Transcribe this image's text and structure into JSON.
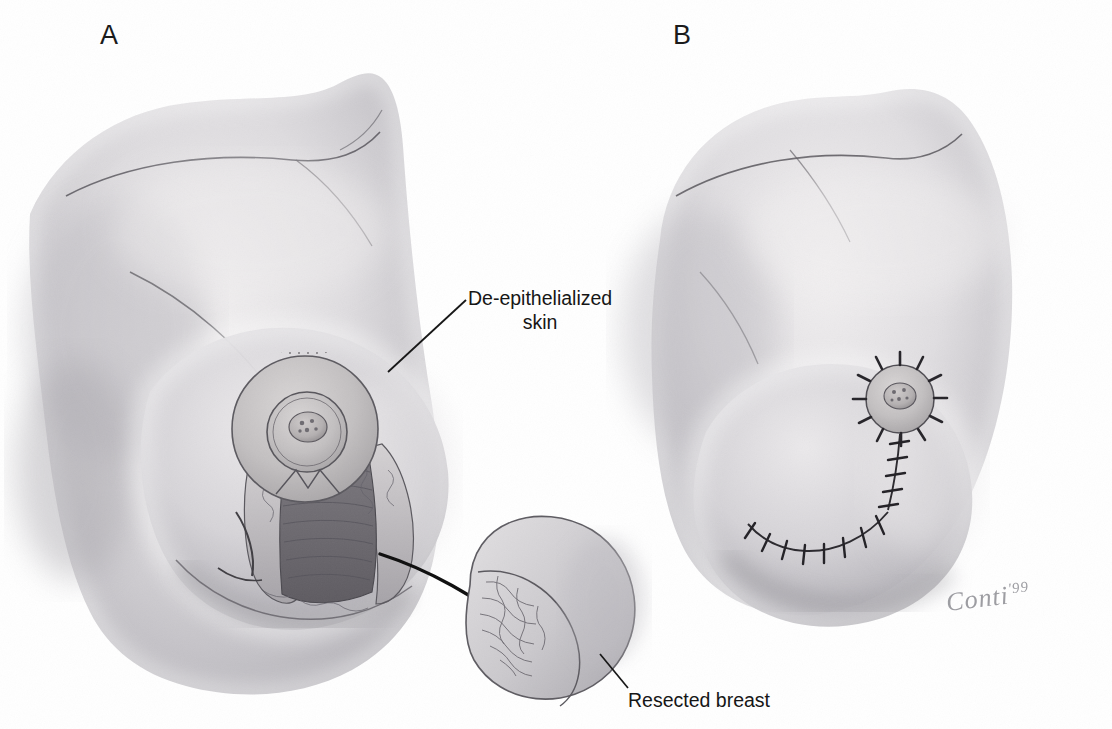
{
  "figure": {
    "type": "medical-illustration",
    "medium": "graphite pencil drawing",
    "background_color": "#ffffff",
    "width": 1112,
    "height": 729
  },
  "panels": [
    {
      "id": "A",
      "letter": "A",
      "description": "Oblique view of female chest and breast with de-epithelialized periareolar skin and inferior wedge resection exposed; curved arrow directs to the excised specimen.",
      "annotations": [
        {
          "name": "de-epithelialized-skin",
          "line1": "De-epithelialized",
          "line2": "skin",
          "leader": "diagonal line from text down-left to the stippled periareolar disc"
        },
        {
          "name": "resected-breast",
          "line1": "Resected breast",
          "leader": "short diagonal line up-left to the crescent specimen"
        }
      ],
      "arrow": {
        "name": "transfer-arrow",
        "style": "curved solid black arrow with filled head",
        "from": "surgical wound bed",
        "to": "resected specimen"
      }
    },
    {
      "id": "B",
      "letter": "B",
      "description": "Post-operative result: reconstructed breast with interrupted sutures radiating around the nipple-areola complex and a vertical suture line joining a curved inframammary suture line.",
      "annotations": []
    }
  ],
  "signature": {
    "name": "artist-signature",
    "text": "Conti",
    "year": "'99",
    "color": "#8d8d93"
  },
  "colors": {
    "ink": "#161616",
    "panel_letter": "#1b1b1b",
    "skin_light": "#e4e2e3",
    "skin_mid": "#cfcdd0",
    "skin_dark": "#a9a7ac",
    "skin_shadow": "#8c8a90",
    "tissue_dark": "#6f6d73",
    "line": "#4a484c",
    "background": "#ffffff"
  }
}
